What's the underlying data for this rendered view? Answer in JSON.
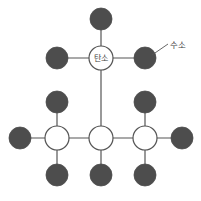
{
  "diagram": {
    "background_color": "#ffffff",
    "bond_color": "#555555",
    "carbon_fill": "#ffffff",
    "carbon_stroke": "#555555",
    "hydrogen_fill": "#4d4d4d",
    "hydrogen_stroke": "#4d4d4d",
    "text_color": "#3f3f3f",
    "carbon_radius": 12,
    "hydrogen_radius": 11,
    "bond_width": 1.2,
    "carbon_stroke_width": 1.2
  },
  "labels": {
    "carbon_label": "탄소",
    "hydrogen_label": "수소"
  },
  "callout": {
    "hydrogen_label_x": 178,
    "hydrogen_label_y": 45,
    "leader_from_x": 152,
    "leader_from_y": 55,
    "leader_to_x": 168,
    "leader_to_y": 44
  },
  "atoms": {
    "carbons": [
      {
        "id": "C-top",
        "name": "carbon-top",
        "x": 101,
        "y": 58,
        "label": "탄소",
        "labeled": true
      },
      {
        "id": "C-left",
        "name": "carbon-bottom-left",
        "x": 57,
        "y": 138,
        "label": "",
        "labeled": false
      },
      {
        "id": "C-center",
        "name": "carbon-bottom-center",
        "x": 101,
        "y": 138,
        "label": "",
        "labeled": false
      },
      {
        "id": "C-right",
        "name": "carbon-bottom-right",
        "x": 145,
        "y": 138,
        "label": "",
        "labeled": false
      }
    ],
    "hydrogens": [
      {
        "id": "H1",
        "name": "hydrogen-top-above-carbon",
        "x": 101,
        "y": 19
      },
      {
        "id": "H2",
        "name": "hydrogen-top-left",
        "x": 57,
        "y": 58
      },
      {
        "id": "H3",
        "name": "hydrogen-top-right-labeled",
        "x": 145,
        "y": 58
      },
      {
        "id": "H4",
        "name": "hydrogen-left-upper",
        "x": 57,
        "y": 102
      },
      {
        "id": "H5",
        "name": "hydrogen-left-outer",
        "x": 20,
        "y": 138
      },
      {
        "id": "H6",
        "name": "hydrogen-left-lower",
        "x": 57,
        "y": 175
      },
      {
        "id": "H7",
        "name": "hydrogen-center-lower",
        "x": 101,
        "y": 175
      },
      {
        "id": "H8",
        "name": "hydrogen-right-upper",
        "x": 145,
        "y": 102
      },
      {
        "id": "H9",
        "name": "hydrogen-right-outer",
        "x": 182,
        "y": 138
      },
      {
        "id": "H10",
        "name": "hydrogen-right-lower",
        "x": 145,
        "y": 175
      }
    ]
  },
  "bonds": [
    {
      "name": "bond-ctop-h1",
      "x1": 101,
      "y1": 58,
      "x2": 101,
      "y2": 19
    },
    {
      "name": "bond-ctop-h2",
      "x1": 101,
      "y1": 58,
      "x2": 57,
      "y2": 58
    },
    {
      "name": "bond-ctop-h3",
      "x1": 101,
      "y1": 58,
      "x2": 145,
      "y2": 58
    },
    {
      "name": "bond-ctop-ccenter",
      "x1": 101,
      "y1": 58,
      "x2": 101,
      "y2": 138
    },
    {
      "name": "bond-cleft-h4",
      "x1": 57,
      "y1": 138,
      "x2": 57,
      "y2": 102
    },
    {
      "name": "bond-cleft-h5",
      "x1": 57,
      "y1": 138,
      "x2": 20,
      "y2": 138
    },
    {
      "name": "bond-cleft-h6",
      "x1": 57,
      "y1": 138,
      "x2": 57,
      "y2": 175
    },
    {
      "name": "bond-cleft-ccenter",
      "x1": 57,
      "y1": 138,
      "x2": 101,
      "y2": 138
    },
    {
      "name": "bond-ccenter-h7",
      "x1": 101,
      "y1": 138,
      "x2": 101,
      "y2": 175
    },
    {
      "name": "bond-ccenter-cright",
      "x1": 101,
      "y1": 138,
      "x2": 145,
      "y2": 138
    },
    {
      "name": "bond-cright-h8",
      "x1": 145,
      "y1": 138,
      "x2": 145,
      "y2": 102
    },
    {
      "name": "bond-cright-h9",
      "x1": 145,
      "y1": 138,
      "x2": 182,
      "y2": 138
    },
    {
      "name": "bond-cright-h10",
      "x1": 145,
      "y1": 138,
      "x2": 145,
      "y2": 175
    }
  ]
}
